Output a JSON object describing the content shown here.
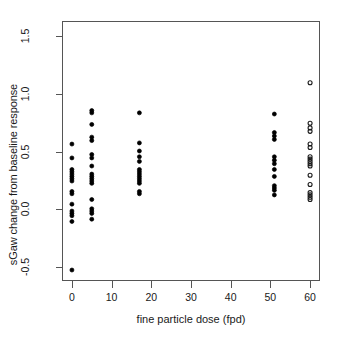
{
  "chart_data": {
    "type": "scatter",
    "title": "",
    "xlabel": "fine particle dose (fpd)",
    "ylabel": "sGaw change from baseline response",
    "xlim": [
      -2.5,
      62.5
    ],
    "ylim": [
      -0.62,
      1.63
    ],
    "xticks": [
      0,
      10,
      20,
      30,
      40,
      50,
      60
    ],
    "xticklabels": [
      "0",
      "10",
      "20",
      "30",
      "40",
      "50",
      "60"
    ],
    "yticks": [
      -0.5,
      0.0,
      0.5,
      1.0,
      1.5
    ],
    "yticklabels": [
      "-0.5",
      "0.0",
      "0.5",
      "1.0",
      "1.5"
    ],
    "grid": false,
    "legend": null,
    "marker_styles": {
      "filled": {
        "shape": "circle",
        "fill": "#000000",
        "stroke": "#000000",
        "size": 4.0
      },
      "open": {
        "shape": "circle",
        "fill": "none",
        "stroke": "#1a1a1a",
        "size": 4.0
      }
    },
    "series": [
      {
        "name": "observed",
        "marker": "filled",
        "points": [
          {
            "x": 0,
            "y": 0.565
          },
          {
            "x": 0,
            "y": 0.445
          },
          {
            "x": 0,
            "y": 0.345
          },
          {
            "x": 0,
            "y": 0.325
          },
          {
            "x": 0,
            "y": 0.305
          },
          {
            "x": 0,
            "y": 0.285
          },
          {
            "x": 0,
            "y": 0.265
          },
          {
            "x": 0,
            "y": 0.245
          },
          {
            "x": 0,
            "y": 0.155
          },
          {
            "x": 0,
            "y": 0.135
          },
          {
            "x": 0,
            "y": 0.045
          },
          {
            "x": 0,
            "y": -0.015
          },
          {
            "x": 0,
            "y": -0.035
          },
          {
            "x": 0,
            "y": -0.055
          },
          {
            "x": 0,
            "y": -0.105
          },
          {
            "x": 0,
            "y": -0.525
          },
          {
            "x": 5,
            "y": 0.855
          },
          {
            "x": 5,
            "y": 0.835
          },
          {
            "x": 5,
            "y": 0.735
          },
          {
            "x": 5,
            "y": 0.625
          },
          {
            "x": 5,
            "y": 0.595
          },
          {
            "x": 5,
            "y": 0.475
          },
          {
            "x": 5,
            "y": 0.445
          },
          {
            "x": 5,
            "y": 0.375
          },
          {
            "x": 5,
            "y": 0.305
          },
          {
            "x": 5,
            "y": 0.285
          },
          {
            "x": 5,
            "y": 0.265
          },
          {
            "x": 5,
            "y": 0.245
          },
          {
            "x": 5,
            "y": 0.225
          },
          {
            "x": 5,
            "y": 0.085
          },
          {
            "x": 5,
            "y": 0.005
          },
          {
            "x": 5,
            "y": -0.015
          },
          {
            "x": 5,
            "y": -0.035
          },
          {
            "x": 5,
            "y": -0.085
          },
          {
            "x": 17,
            "y": 0.835
          },
          {
            "x": 17,
            "y": 0.575
          },
          {
            "x": 17,
            "y": 0.505
          },
          {
            "x": 17,
            "y": 0.455
          },
          {
            "x": 17,
            "y": 0.415
          },
          {
            "x": 17,
            "y": 0.345
          },
          {
            "x": 17,
            "y": 0.325
          },
          {
            "x": 17,
            "y": 0.305
          },
          {
            "x": 17,
            "y": 0.285
          },
          {
            "x": 17,
            "y": 0.265
          },
          {
            "x": 17,
            "y": 0.245
          },
          {
            "x": 17,
            "y": 0.225
          },
          {
            "x": 17,
            "y": 0.155
          },
          {
            "x": 17,
            "y": 0.135
          },
          {
            "x": 51,
            "y": 0.825
          },
          {
            "x": 51,
            "y": 0.665
          },
          {
            "x": 51,
            "y": 0.635
          },
          {
            "x": 51,
            "y": 0.605
          },
          {
            "x": 51,
            "y": 0.455
          },
          {
            "x": 51,
            "y": 0.425
          },
          {
            "x": 51,
            "y": 0.395
          },
          {
            "x": 51,
            "y": 0.345
          },
          {
            "x": 51,
            "y": 0.285
          },
          {
            "x": 51,
            "y": 0.205
          },
          {
            "x": 51,
            "y": 0.185
          },
          {
            "x": 51,
            "y": 0.165
          },
          {
            "x": 51,
            "y": 0.125
          }
        ]
      },
      {
        "name": "predicted",
        "marker": "open",
        "points": [
          {
            "x": 60,
            "y": 1.095
          },
          {
            "x": 60,
            "y": 0.745
          },
          {
            "x": 60,
            "y": 0.705
          },
          {
            "x": 60,
            "y": 0.675
          },
          {
            "x": 60,
            "y": 0.565
          },
          {
            "x": 60,
            "y": 0.535
          },
          {
            "x": 60,
            "y": 0.455
          },
          {
            "x": 60,
            "y": 0.435
          },
          {
            "x": 60,
            "y": 0.415
          },
          {
            "x": 60,
            "y": 0.395
          },
          {
            "x": 60,
            "y": 0.375
          },
          {
            "x": 60,
            "y": 0.295
          },
          {
            "x": 60,
            "y": 0.215
          },
          {
            "x": 60,
            "y": 0.145
          },
          {
            "x": 60,
            "y": 0.125
          },
          {
            "x": 60,
            "y": 0.105
          },
          {
            "x": 60,
            "y": 0.085
          }
        ]
      }
    ]
  }
}
